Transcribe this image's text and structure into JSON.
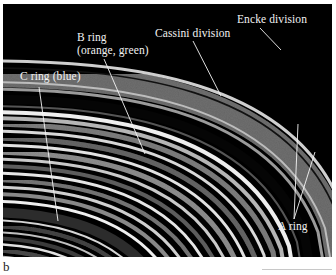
{
  "figure": {
    "labels": {
      "b_ring_line1": "B ring",
      "b_ring_line2": "(orange, green)",
      "c_ring": "C ring (blue)",
      "cassini": "Cassini division",
      "encke": "Encke division",
      "a_ring": "A ring"
    },
    "colors": {
      "background": "#000000",
      "ring_bright": "#e8e8e8",
      "ring_mid": "#8a8a8a",
      "ring_dark": "#3a3a3a",
      "label_text": "#f2f2f2"
    }
  },
  "caption": {
    "panel_letter": "b"
  }
}
